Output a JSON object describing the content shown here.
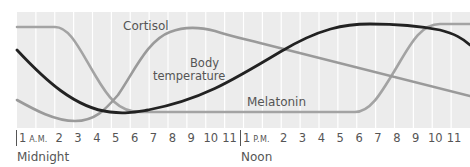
{
  "chart_data": {
    "type": "line",
    "title": "",
    "xlabel": "",
    "ylabel": "",
    "grid": "vertical",
    "categories": [
      "1 A.M.",
      "2",
      "3",
      "4",
      "5",
      "6",
      "7",
      "8",
      "9",
      "10",
      "11",
      "Noon",
      "1 P.M.",
      "2",
      "3",
      "4",
      "5",
      "6",
      "7",
      "8",
      "9",
      "10",
      "11",
      "Midnight"
    ],
    "tick_labels_am": [
      "1 A.M.",
      "2",
      "3",
      "4",
      "5",
      "6",
      "7",
      "8",
      "9",
      "10",
      "11"
    ],
    "tick_labels_pm": [
      "1 P.M.",
      "2",
      "3",
      "4",
      "5",
      "6",
      "7",
      "8",
      "9",
      "10",
      "11"
    ],
    "sublabels": {
      "am": "Midnight",
      "pm": "Noon"
    },
    "series": [
      {
        "name": "Cortisol",
        "color": "#9a9a9a",
        "values": [
          0.24,
          0.12,
          0.06,
          0.08,
          0.25,
          0.55,
          0.8,
          0.92,
          0.95,
          0.94,
          0.88,
          0.84,
          0.8,
          0.76,
          0.72,
          0.67,
          0.63,
          0.59,
          0.55,
          0.5,
          0.46,
          0.42,
          0.38,
          0.33
        ]
      },
      {
        "name": "Melatonin",
        "color": "#a6a6a6",
        "values": [
          0.96,
          0.96,
          0.9,
          0.6,
          0.3,
          0.14,
          0.13,
          0.13,
          0.13,
          0.13,
          0.13,
          0.13,
          0.13,
          0.13,
          0.13,
          0.13,
          0.13,
          0.13,
          0.22,
          0.55,
          0.85,
          0.98,
          0.98,
          0.98
        ]
      },
      {
        "name": "Body temperature",
        "color": "#222222",
        "values": [
          0.75,
          0.58,
          0.42,
          0.3,
          0.2,
          0.14,
          0.13,
          0.17,
          0.24,
          0.32,
          0.41,
          0.49,
          0.58,
          0.67,
          0.76,
          0.85,
          0.93,
          0.97,
          0.98,
          0.98,
          0.96,
          0.92,
          0.86,
          0.78
        ]
      }
    ],
    "annotations": [
      "Cortisol",
      "Body temperature",
      "Melatonin"
    ]
  },
  "labels": {
    "cortisol": "Cortisol",
    "body_temp_line1": "Body",
    "body_temp_line2": "temperature",
    "melatonin": "Melatonin"
  },
  "axis": {
    "am_first": "1",
    "am_suffix": "A.M.",
    "pm_first": "1",
    "pm_suffix": "P.M.",
    "am_hours": [
      "2",
      "3",
      "4",
      "5",
      "6",
      "7",
      "8",
      "9",
      "10",
      "11"
    ],
    "pm_hours": [
      "2",
      "3",
      "4",
      "5",
      "6",
      "7",
      "8",
      "9",
      "10",
      "11"
    ],
    "midnight": "Midnight",
    "noon": "Noon"
  }
}
